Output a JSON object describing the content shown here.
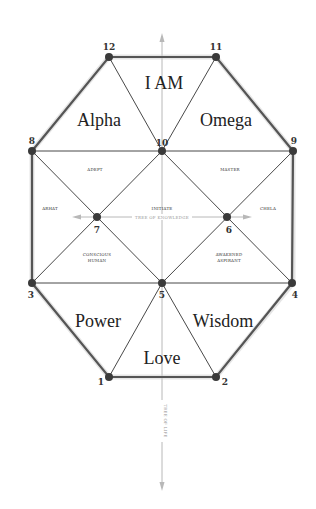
{
  "diagram": {
    "nodes": [
      {
        "id": "1",
        "label": "1"
      },
      {
        "id": "2",
        "label": "2"
      },
      {
        "id": "3",
        "label": "3"
      },
      {
        "id": "4",
        "label": "4"
      },
      {
        "id": "5",
        "label": "5"
      },
      {
        "id": "6",
        "label": "6"
      },
      {
        "id": "7",
        "label": "7"
      },
      {
        "id": "8",
        "label": "8"
      },
      {
        "id": "9",
        "label": "9"
      },
      {
        "id": "10",
        "label": "10"
      },
      {
        "id": "11",
        "label": "11"
      },
      {
        "id": "12",
        "label": "12"
      }
    ],
    "regions": {
      "i_am": "I AM",
      "alpha": "Alpha",
      "omega": "Omega",
      "power": "Power",
      "wisdom": "Wisdom",
      "love": "Love"
    },
    "small_regions": {
      "adept": "ADEPT",
      "master": "MASTER",
      "arhat": "ARHAT",
      "chela": "CHELA",
      "initiate": "INITIATE",
      "conscious_human_1": "CONSCIOUS",
      "conscious_human_2": "HUMAN",
      "awakened_aspirant_1": "AWAKENED",
      "awakened_aspirant_2": "ASPIRANT"
    },
    "axes": {
      "horizontal": "TREE OF KNOWLEDGE",
      "vertical": "TREE OF LIFE"
    }
  }
}
